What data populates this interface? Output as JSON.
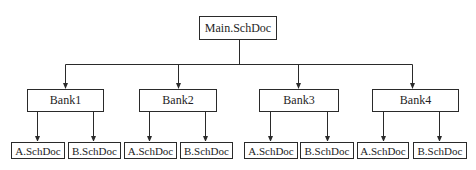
{
  "diagram": {
    "type": "tree",
    "title": "",
    "line_color": "#2a2a2a",
    "root": {
      "label": "Main.SchDoc",
      "box": [
        199,
        16,
        78,
        24
      ]
    },
    "bus_y": 64,
    "root_drop_x": 239,
    "bus_x_range": [
      65,
      412
    ],
    "banks": [
      {
        "label": "Bank1",
        "box": [
          27,
          89,
          77,
          23
        ],
        "drop_x": 65,
        "children": [
          {
            "label": "A.SchDoc",
            "box": [
              11,
              142,
              54,
              17
            ],
            "drop_x": 37
          },
          {
            "label": "B.SchDoc",
            "box": [
              68,
              142,
              53,
              17
            ],
            "drop_x": 93
          }
        ]
      },
      {
        "label": "Bank2",
        "box": [
          139,
          89,
          78,
          23
        ],
        "drop_x": 178,
        "children": [
          {
            "label": "A.SchDoc",
            "box": [
              124,
              142,
              53,
              17
            ],
            "drop_x": 149
          },
          {
            "label": "B.SchDoc",
            "box": [
              180,
              142,
              53,
              17
            ],
            "drop_x": 205
          }
        ]
      },
      {
        "label": "Bank3",
        "box": [
          259,
          89,
          80,
          23
        ],
        "drop_x": 298,
        "children": [
          {
            "label": "A.SchDoc",
            "box": [
              244,
              142,
              54,
              17
            ],
            "drop_x": 270
          },
          {
            "label": "B.SchDoc",
            "box": [
              300,
              142,
              54,
              17
            ],
            "drop_x": 327
          }
        ]
      },
      {
        "label": "Bank4",
        "box": [
          372,
          89,
          87,
          23
        ],
        "drop_x": 412,
        "children": [
          {
            "label": "A.SchDoc",
            "box": [
              357,
              142,
              52,
              17
            ],
            "drop_x": 383
          },
          {
            "label": "B.SchDoc",
            "box": [
              413,
              142,
              54,
              17
            ],
            "drop_x": 439
          }
        ]
      }
    ]
  }
}
